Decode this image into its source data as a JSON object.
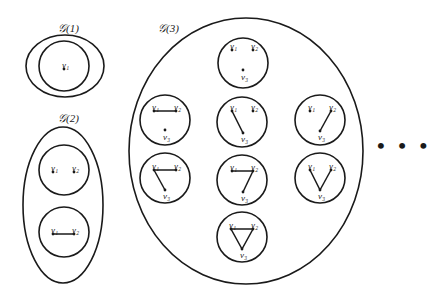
{
  "diagram": {
    "groups": [
      {
        "id": "G1",
        "label": "𝒢(1)",
        "shape": "ellipse",
        "graphs": [
          {
            "vertices": [
              "v1"
            ],
            "edges": []
          }
        ]
      },
      {
        "id": "G2",
        "label": "𝒢(2)",
        "shape": "ellipse",
        "graphs": [
          {
            "vertices": [
              "v1",
              "v2"
            ],
            "edges": []
          },
          {
            "vertices": [
              "v1",
              "v2"
            ],
            "edges": [
              [
                "v1",
                "v2"
              ]
            ]
          }
        ]
      },
      {
        "id": "G3",
        "label": "𝒢(3)",
        "shape": "circle",
        "graphs": [
          {
            "vertices": [
              "v1",
              "v2",
              "v3"
            ],
            "edges": []
          },
          {
            "vertices": [
              "v1",
              "v2",
              "v3"
            ],
            "edges": [
              [
                "v1",
                "v2"
              ]
            ]
          },
          {
            "vertices": [
              "v1",
              "v2",
              "v3"
            ],
            "edges": [
              [
                "v1",
                "v3"
              ]
            ]
          },
          {
            "vertices": [
              "v1",
              "v2",
              "v3"
            ],
            "edges": [
              [
                "v2",
                "v3"
              ]
            ]
          },
          {
            "vertices": [
              "v1",
              "v2",
              "v3"
            ],
            "edges": [
              [
                "v1",
                "v2"
              ],
              [
                "v1",
                "v3"
              ]
            ]
          },
          {
            "vertices": [
              "v1",
              "v2",
              "v3"
            ],
            "edges": [
              [
                "v1",
                "v2"
              ],
              [
                "v2",
                "v3"
              ]
            ]
          },
          {
            "vertices": [
              "v1",
              "v2",
              "v3"
            ],
            "edges": [
              [
                "v1",
                "v3"
              ],
              [
                "v2",
                "v3"
              ]
            ]
          },
          {
            "vertices": [
              "v1",
              "v2",
              "v3"
            ],
            "edges": [
              [
                "v1",
                "v2"
              ],
              [
                "v1",
                "v3"
              ],
              [
                "v2",
                "v3"
              ]
            ]
          }
        ]
      }
    ],
    "vertex_labels": {
      "v1": "ν₁",
      "v2": "ν₂",
      "v3": "ν₃"
    },
    "continuation": "• • •"
  }
}
